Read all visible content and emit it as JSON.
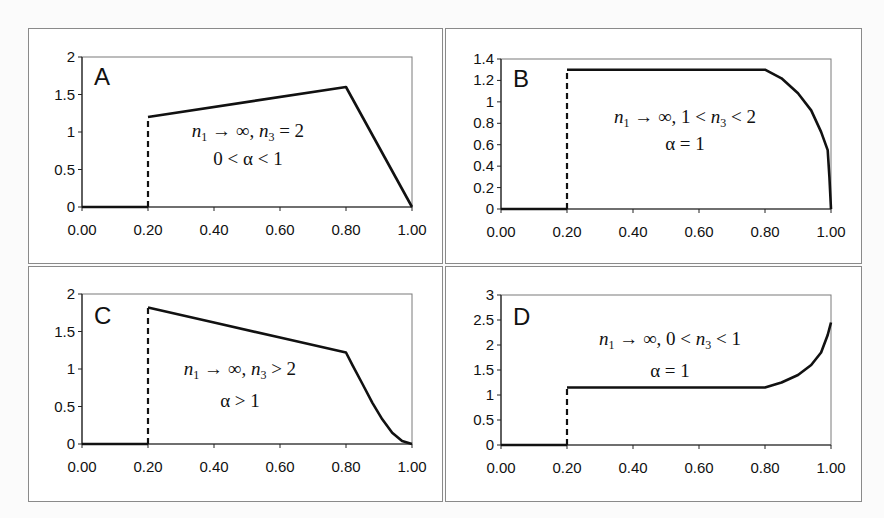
{
  "figure": {
    "panels_layout": "2x2",
    "line_color": "#111111",
    "frame_color": "#8a8a8a"
  },
  "chart_data": [
    {
      "type": "line",
      "panel": "A",
      "title": "",
      "xlabel": "",
      "ylabel": "",
      "x_ticks": [
        "0.00",
        "0.20",
        "0.40",
        "0.60",
        "0.80",
        "1.00"
      ],
      "y_ticks": [
        "0",
        "0.5",
        "1",
        "1.5",
        "2"
      ],
      "xlim": [
        0,
        1
      ],
      "ylim": [
        0,
        2
      ],
      "grid": false,
      "annotation_line1": {
        "n1": "n",
        "sub1": "1",
        "arrow": " → ∞,  ",
        "n3": "n",
        "sub3": "3",
        "rest": " = 2"
      },
      "annotation_line2": "0 < α < 1",
      "series": [
        {
          "name": "zero segment",
          "style": "solid",
          "x": [
            0.0,
            0.2
          ],
          "y": [
            0,
            0
          ]
        },
        {
          "name": "jump",
          "style": "dashed",
          "x": [
            0.2,
            0.2
          ],
          "y": [
            0,
            1.2
          ]
        },
        {
          "name": "main curve",
          "style": "solid",
          "x": [
            0.2,
            0.8,
            1.0
          ],
          "y": [
            1.2,
            1.6,
            0.0
          ]
        }
      ]
    },
    {
      "type": "line",
      "panel": "B",
      "title": "",
      "xlabel": "",
      "ylabel": "",
      "x_ticks": [
        "0.00",
        "0.20",
        "0.40",
        "0.60",
        "0.80",
        "1.00"
      ],
      "y_ticks": [
        "0",
        "0.2",
        "0.4",
        "0.6",
        "0.8",
        "1",
        "1.2",
        "1.4"
      ],
      "xlim": [
        0,
        1
      ],
      "ylim": [
        0,
        1.4
      ],
      "grid": false,
      "annotation_line1": {
        "n1": "n",
        "sub1": "1",
        "arrow": " → ∞,  1 < ",
        "n3": "n",
        "sub3": "3",
        "rest": " < 2"
      },
      "annotation_line2": "α = 1",
      "series": [
        {
          "name": "zero segment",
          "style": "solid",
          "x": [
            0.0,
            0.2
          ],
          "y": [
            0,
            0
          ]
        },
        {
          "name": "jump",
          "style": "dashed",
          "x": [
            0.2,
            0.2
          ],
          "y": [
            0,
            1.3
          ]
        },
        {
          "name": "main curve",
          "style": "solid",
          "x": [
            0.2,
            0.8,
            0.85,
            0.9,
            0.94,
            0.97,
            0.99,
            0.995,
            1.0
          ],
          "y": [
            1.3,
            1.3,
            1.22,
            1.08,
            0.92,
            0.72,
            0.55,
            0.3,
            0.0
          ]
        }
      ]
    },
    {
      "type": "line",
      "panel": "C",
      "title": "",
      "xlabel": "",
      "ylabel": "",
      "x_ticks": [
        "0.00",
        "0.20",
        "0.40",
        "0.60",
        "0.80",
        "1.00"
      ],
      "y_ticks": [
        "0",
        "0.5",
        "1",
        "1.5",
        "2"
      ],
      "xlim": [
        0,
        1
      ],
      "ylim": [
        0,
        2
      ],
      "grid": false,
      "annotation_line1": {
        "n1": "n",
        "sub1": "1",
        "arrow": " → ∞, ",
        "n3": "n",
        "sub3": "3",
        "rest": " > 2"
      },
      "annotation_line2": "α > 1",
      "series": [
        {
          "name": "zero segment",
          "style": "solid",
          "x": [
            0.0,
            0.2
          ],
          "y": [
            0,
            0
          ]
        },
        {
          "name": "jump",
          "style": "dashed",
          "x": [
            0.2,
            0.2
          ],
          "y": [
            0,
            1.82
          ]
        },
        {
          "name": "main curve",
          "style": "solid",
          "x": [
            0.2,
            0.4,
            0.6,
            0.8,
            0.82,
            0.85,
            0.88,
            0.91,
            0.94,
            0.97,
            1.0
          ],
          "y": [
            1.82,
            1.62,
            1.42,
            1.22,
            1.05,
            0.8,
            0.55,
            0.33,
            0.15,
            0.04,
            0.0
          ]
        }
      ]
    },
    {
      "type": "line",
      "panel": "D",
      "title": "",
      "xlabel": "",
      "ylabel": "",
      "x_ticks": [
        "0.00",
        "0.20",
        "0.40",
        "0.60",
        "0.80",
        "1.00"
      ],
      "y_ticks": [
        "0",
        "0.5",
        "1",
        "1.5",
        "2",
        "2.5",
        "3"
      ],
      "xlim": [
        0,
        1
      ],
      "ylim": [
        0,
        3
      ],
      "grid": false,
      "annotation_line1": {
        "n1": "n",
        "sub1": "1",
        "arrow": " → ∞,  0 < ",
        "n3": "n",
        "sub3": "3",
        "rest": " < 1"
      },
      "annotation_line2": "α = 1",
      "series": [
        {
          "name": "zero segment",
          "style": "solid",
          "x": [
            0.0,
            0.2
          ],
          "y": [
            0,
            0
          ]
        },
        {
          "name": "jump",
          "style": "dashed",
          "x": [
            0.2,
            0.2
          ],
          "y": [
            0,
            1.15
          ]
        },
        {
          "name": "main curve",
          "style": "solid",
          "x": [
            0.2,
            0.8,
            0.85,
            0.9,
            0.94,
            0.97,
            0.99,
            1.0
          ],
          "y": [
            1.15,
            1.15,
            1.25,
            1.4,
            1.6,
            1.85,
            2.2,
            2.45
          ]
        }
      ]
    }
  ],
  "labels": {
    "A": "A",
    "B": "B",
    "C": "C",
    "D": "D"
  }
}
